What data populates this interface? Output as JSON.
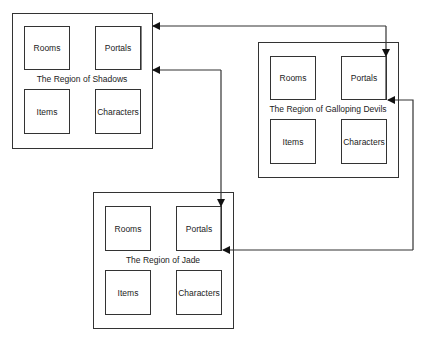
{
  "diagram": {
    "regions": [
      {
        "id": "shadows",
        "title": "The Region of Shadows",
        "nodes": [
          "Rooms",
          "Portals",
          "Items",
          "Characters"
        ]
      },
      {
        "id": "galloping-devils",
        "title": "The Region of Galloping Devils",
        "nodes": [
          "Rooms",
          "Portals",
          "Items",
          "Characters"
        ]
      },
      {
        "id": "jade",
        "title": "The Region of Jade",
        "nodes": [
          "Rooms",
          "Portals",
          "Items",
          "Characters"
        ]
      }
    ],
    "edges": [
      {
        "from": "galloping-devils.Portals",
        "to": "shadows.Portals",
        "label": ""
      },
      {
        "from": "shadows.Portals",
        "to": "galloping-devils.Portals",
        "label": ""
      },
      {
        "from": "jade.Portals",
        "to": "shadows.Portals",
        "label": ""
      },
      {
        "from": "shadows.Portals",
        "to": "jade.Portals",
        "label": ""
      },
      {
        "from": "galloping-devils.Portals",
        "to": "jade.Portals",
        "label": ""
      },
      {
        "from": "jade.Portals",
        "to": "galloping-devils.Portals",
        "label": ""
      }
    ],
    "colors": {
      "stroke": "#333333",
      "text": "#222222",
      "background": "#ffffff"
    }
  }
}
